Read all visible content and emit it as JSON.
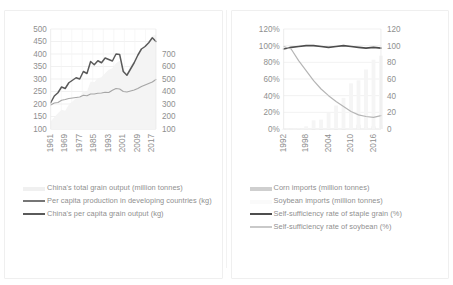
{
  "figure": {
    "panels": [
      {
        "id": "left-panel",
        "name": "grain-output-chart",
        "chart": {
          "type": "line",
          "title": "",
          "xlabel": "",
          "ylabel": "",
          "x": [
            1961,
            1963,
            1965,
            1967,
            1969,
            1971,
            1973,
            1975,
            1977,
            1979,
            1981,
            1983,
            1985,
            1987,
            1989,
            1991,
            1993,
            1995,
            1997,
            1999,
            2001,
            2003,
            2005,
            2007,
            2009,
            2011,
            2013,
            2015,
            2017,
            2019
          ],
          "xtick_labels": [
            "1961",
            "1969",
            "1977",
            "1985",
            "1993",
            "2001",
            "2009",
            "2017"
          ],
          "y_left_label": "",
          "y_left_ticks": [
            "100",
            "150",
            "200",
            "250",
            "300",
            "350",
            "400",
            "450",
            "500"
          ],
          "ylim_left": [
            100,
            500
          ],
          "y_right_label": "",
          "y_right_ticks": [
            "100",
            "200",
            "300",
            "400",
            "500",
            "600",
            "700"
          ],
          "ylim_right": [
            100,
            700
          ],
          "grid": true,
          "legend_position": "bottom",
          "series": [
            {
              "name": "China's total grain output (million tonnes)",
              "unit": "million tonnes",
              "axis": "right",
              "style": "area",
              "color": "#f4f4f4",
              "values": [
                145,
                170,
                195,
                215,
                210,
                245,
                265,
                285,
                285,
                330,
                325,
                385,
                380,
                405,
                410,
                435,
                455,
                465,
                495,
                510,
                455,
                430,
                485,
                500,
                530,
                570,
                600,
                620,
                660,
                665
              ]
            },
            {
              "name": "Per capita production in developing countries (kg)",
              "unit": "kg",
              "axis": "left",
              "style": "line",
              "color": "#a6a6a6",
              "values": [
                196,
                204,
                206,
                215,
                218,
                222,
                224,
                226,
                228,
                235,
                233,
                240,
                240,
                243,
                244,
                247,
                246,
                255,
                262,
                260,
                250,
                248,
                252,
                256,
                262,
                270,
                276,
                282,
                288,
                298
              ]
            },
            {
              "name": "China's per capita grain output (kg)",
              "unit": "kg",
              "axis": "left",
              "style": "line",
              "color": "#5a5a5a",
              "values": [
                205,
                232,
                245,
                268,
                262,
                285,
                295,
                305,
                300,
                330,
                322,
                370,
                357,
                373,
                365,
                384,
                378,
                372,
                400,
                398,
                330,
                315,
                340,
                365,
                395,
                420,
                430,
                445,
                465,
                450
              ]
            }
          ]
        },
        "legend": [
          {
            "label": "China's total grain output (million tonnes)",
            "color": "#f0f0f0",
            "marker": "bar"
          },
          {
            "label": "Per capita production in developing countries (kg)",
            "color": "#767676",
            "marker": "line"
          },
          {
            "label": "China's per capita grain output (kg)",
            "color": "#5a5a5a",
            "marker": "line"
          }
        ]
      },
      {
        "id": "right-panel",
        "name": "self-sufficiency-chart",
        "chart": {
          "type": "line",
          "title": "",
          "xlabel": "",
          "ylabel": "",
          "x": [
            1992,
            1994,
            1996,
            1998,
            2000,
            2002,
            2004,
            2006,
            2008,
            2010,
            2012,
            2014,
            2016,
            2018
          ],
          "xtick_labels": [
            "1992",
            "1998",
            "2004",
            "2010",
            "2016"
          ],
          "y_left_label": "",
          "y_left_ticks": [
            "0%",
            "20%",
            "40%",
            "60%",
            "80%",
            "100%",
            "120%"
          ],
          "ylim_left": [
            0,
            120
          ],
          "y_right_label": "",
          "y_right_ticks": [
            "0",
            "20",
            "40",
            "60",
            "80",
            "100",
            "120"
          ],
          "ylim_right": [
            0,
            120
          ],
          "grid": true,
          "legend_position": "bottom",
          "series": [
            {
              "name": "Corn imports (million tonnes)",
              "unit": "million tonnes",
              "axis": "right",
              "style": "bar",
              "color": "#e3e3e3",
              "values": [
                0.1,
                0.2,
                0.4,
                0.3,
                0.1,
                0.1,
                0.2,
                0.1,
                0.1,
                1.6,
                5.2,
                2.6,
                3.2,
                4.5
              ]
            },
            {
              "name": "Soybean imports (million tonnes)",
              "unit": "million tonnes",
              "axis": "right",
              "style": "bar",
              "color": "#f5f5f5",
              "values": [
                0.1,
                0.1,
                1.1,
                3.2,
                10.4,
                11.3,
                20.2,
                28.2,
                37.4,
                54.8,
                58.4,
                71.4,
                83.2,
                88.0
              ]
            },
            {
              "name": "Self-sufficiency rate of staple grain (%)",
              "unit": "%",
              "axis": "left",
              "style": "line",
              "color": "#4d4d4d",
              "values": [
                96,
                98,
                99,
                100,
                100,
                99,
                98,
                99,
                100,
                99,
                98,
                97,
                98,
                97
              ]
            },
            {
              "name": "Self-sufficiency rate of soybean (%)",
              "unit": "%",
              "axis": "left",
              "style": "line",
              "color": "#b5b5b5",
              "values": [
                99,
                96,
                82,
                70,
                58,
                48,
                40,
                33,
                27,
                21,
                17,
                15,
                14,
                16
              ]
            }
          ]
        },
        "legend": [
          {
            "label": "Corn imports (million tonnes)",
            "color": "#cfcfcf",
            "marker": "bar"
          },
          {
            "label": "Soybean imports (million tonnes)",
            "color": "#fafafa",
            "marker": "bar"
          },
          {
            "label": "Self-sufficiency rate of staple grain (%)",
            "color": "#4d4d4d",
            "marker": "line"
          },
          {
            "label": "Self-sufficiency rate of soybean (%)",
            "color": "#c9c9c9",
            "marker": "line"
          }
        ]
      }
    ]
  },
  "chart_data": [
    {
      "type": "line",
      "title": "China's grain output and per capita production",
      "xlabel": "",
      "ylabel": "",
      "x": [
        1961,
        1963,
        1965,
        1967,
        1969,
        1971,
        1973,
        1975,
        1977,
        1979,
        1981,
        1983,
        1985,
        1987,
        1989,
        1991,
        1993,
        1995,
        1997,
        1999,
        2001,
        2003,
        2005,
        2007,
        2009,
        2011,
        2013,
        2015,
        2017,
        2019
      ],
      "xtick_labels": [
        "1961",
        "1969",
        "1977",
        "1985",
        "1993",
        "2001",
        "2009",
        "2017"
      ],
      "ylim": [
        100,
        500
      ],
      "ylim_secondary": [
        100,
        700
      ],
      "ytick_labels": [
        "100",
        "150",
        "200",
        "250",
        "300",
        "350",
        "400",
        "450",
        "500"
      ],
      "ytick_labels_secondary": [
        "100",
        "200",
        "300",
        "400",
        "500",
        "600",
        "700"
      ],
      "grid": true,
      "legend_position": "bottom",
      "series": [
        {
          "name": "China's total grain output (million tonnes)",
          "axis": "secondary",
          "values": [
            145,
            170,
            195,
            215,
            210,
            245,
            265,
            285,
            285,
            330,
            325,
            385,
            380,
            405,
            410,
            435,
            455,
            465,
            495,
            510,
            455,
            430,
            485,
            500,
            530,
            570,
            600,
            620,
            660,
            665
          ]
        },
        {
          "name": "Per capita production in developing countries (kg)",
          "axis": "primary",
          "values": [
            196,
            204,
            206,
            215,
            218,
            222,
            224,
            226,
            228,
            235,
            233,
            240,
            240,
            243,
            244,
            247,
            246,
            255,
            262,
            260,
            250,
            248,
            252,
            256,
            262,
            270,
            276,
            282,
            288,
            298
          ]
        },
        {
          "name": "China's per capita grain output (kg)",
          "axis": "primary",
          "values": [
            205,
            232,
            245,
            268,
            262,
            285,
            295,
            305,
            300,
            330,
            322,
            370,
            357,
            373,
            365,
            384,
            378,
            372,
            400,
            398,
            330,
            315,
            340,
            365,
            395,
            420,
            430,
            445,
            465,
            450
          ]
        }
      ]
    },
    {
      "type": "line",
      "title": "Self-sufficiency rates and imports",
      "xlabel": "",
      "ylabel": "",
      "x": [
        1992,
        1994,
        1996,
        1998,
        2000,
        2002,
        2004,
        2006,
        2008,
        2010,
        2012,
        2014,
        2016,
        2018
      ],
      "xtick_labels": [
        "1992",
        "1998",
        "2004",
        "2010",
        "2016"
      ],
      "ylim": [
        0,
        120
      ],
      "ylim_secondary": [
        0,
        120
      ],
      "ytick_labels": [
        "0%",
        "20%",
        "40%",
        "60%",
        "80%",
        "100%",
        "120%"
      ],
      "ytick_labels_secondary": [
        "0",
        "20",
        "40",
        "60",
        "80",
        "100",
        "120"
      ],
      "grid": true,
      "legend_position": "bottom",
      "series": [
        {
          "name": "Corn imports (million tonnes)",
          "axis": "secondary",
          "values": [
            0.1,
            0.2,
            0.4,
            0.3,
            0.1,
            0.1,
            0.2,
            0.1,
            0.1,
            1.6,
            5.2,
            2.6,
            3.2,
            4.5
          ]
        },
        {
          "name": "Soybean imports (million tonnes)",
          "axis": "secondary",
          "values": [
            0.1,
            0.1,
            1.1,
            3.2,
            10.4,
            11.3,
            20.2,
            28.2,
            37.4,
            54.8,
            58.4,
            71.4,
            83.2,
            88.0
          ]
        },
        {
          "name": "Self-sufficiency rate of staple grain (%)",
          "axis": "primary",
          "values": [
            96,
            98,
            99,
            100,
            100,
            99,
            98,
            99,
            100,
            99,
            98,
            97,
            98,
            97
          ]
        },
        {
          "name": "Self-sufficiency rate of soybean (%)",
          "axis": "primary",
          "values": [
            99,
            96,
            82,
            70,
            58,
            48,
            40,
            33,
            27,
            21,
            17,
            15,
            14,
            16
          ]
        }
      ]
    }
  ]
}
